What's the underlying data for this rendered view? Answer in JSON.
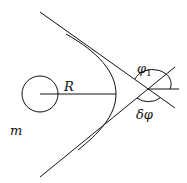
{
  "diagram": {
    "labels": {
      "radius": "R",
      "angle_in": "φ",
      "angle_in_sub": "1",
      "angle_deflection": "δφ",
      "mass": "m"
    },
    "stroke_color": "#111111",
    "background": "#ffffff"
  }
}
